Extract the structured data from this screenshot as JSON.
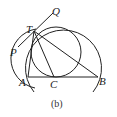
{
  "diagram": {
    "caption": "(b)",
    "points": {
      "T": {
        "label": "T",
        "x": 33,
        "y": 31
      },
      "Q": {
        "label": "Q",
        "x": 53,
        "y": 16
      },
      "P": {
        "label": "P",
        "x": 13,
        "y": 51
      },
      "A": {
        "label": "A",
        "x": 27,
        "y": 77
      },
      "C": {
        "label": "C",
        "x": 54,
        "y": 77
      },
      "B": {
        "label": "B",
        "x": 98,
        "y": 77
      }
    },
    "stroke_color": "#222222",
    "background": "#ffffff"
  }
}
